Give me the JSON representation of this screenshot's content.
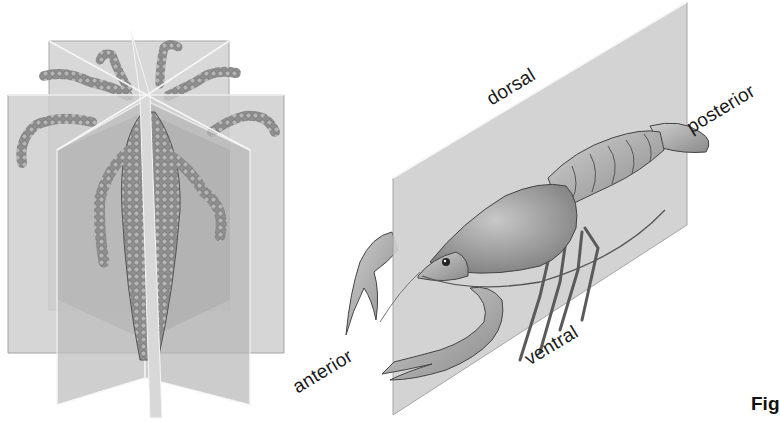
{
  "figure": {
    "caption_fragment": "Fig",
    "left_panel": {
      "subject": "radially symmetric organism (hydra-like) with multiple planes of symmetry",
      "planes": 4
    },
    "right_panel": {
      "subject": "crayfish bisected by a single sagittal plane (bilateral symmetry)",
      "labels": {
        "dorsal": "dorsal",
        "posterior": "posterior",
        "anterior": "anterior",
        "ventral": "ventral"
      }
    },
    "colors": {
      "background": "#ffffff",
      "plane_fill": "#c9c9c9",
      "plane_dark": "#9a9a9a",
      "organism": "#8c8c8c",
      "text": "#1a1a1a"
    }
  }
}
